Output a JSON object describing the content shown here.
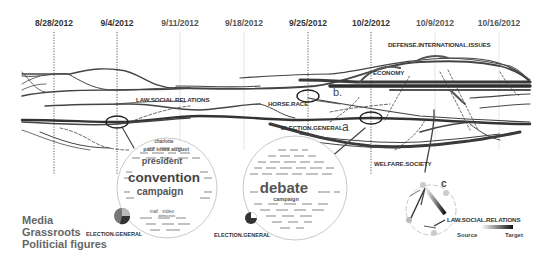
{
  "timeline": {
    "dates": [
      {
        "label": "8/28/2012",
        "x": 54,
        "bold": true,
        "marker": "dotted"
      },
      {
        "label": "9/4/2012",
        "x": 117,
        "bold": true,
        "marker": "dotted"
      },
      {
        "label": "9/11/2012",
        "x": 180,
        "bold": false,
        "marker": "faint"
      },
      {
        "label": "9/18/2012",
        "x": 244,
        "bold": false,
        "marker": "faint"
      },
      {
        "label": "9/25/2012",
        "x": 308,
        "bold": true,
        "marker": "dotted"
      },
      {
        "label": "10/2/2012",
        "x": 371,
        "bold": true,
        "marker": "dotted"
      },
      {
        "label": "10/9/2012",
        "x": 435,
        "bold": false,
        "marker": "faint"
      },
      {
        "label": "10/16/2012",
        "x": 499,
        "bold": false,
        "marker": "faint"
      }
    ]
  },
  "topics": {
    "defense": "DEFENSE.INTERNATIONAL.ISSUES",
    "economy": "ECONOMY",
    "law": "LAW.SOCIAL.RELATIONS",
    "horse_race": "HORSE.RACE",
    "election": "ELECTION.GENERAL",
    "welfare": "WELFARE.SOCIETY"
  },
  "annotations": {
    "a": "a",
    "b": "b.",
    "c": "c"
  },
  "wordcloud_a": {
    "topic_label": "ELECTION.GENERAL",
    "words": {
      "main": "convention",
      "second": "campaign",
      "third": "president",
      "w1": "paul",
      "w2": "iowa",
      "w3": "august",
      "w4": "charlotte",
      "w5": "mail",
      "w6": "video",
      "w7": "democratic"
    }
  },
  "wordcloud_b": {
    "topic_label": "ELECTION.GENERAL",
    "words": {
      "main": "debate",
      "second": "campaign"
    }
  },
  "flow_view": {
    "topic_label": "LAW.SOCIAL.RELATIONS",
    "gradient_source": "Source",
    "gradient_target": "Target"
  },
  "legend": {
    "items": [
      "Media",
      "Grassroots",
      "Politicial figures"
    ]
  },
  "colors": {
    "stream": "#3a3a3a",
    "stream_light": "#8a8a8a",
    "text": "#333333",
    "legend_text": "#666666"
  }
}
